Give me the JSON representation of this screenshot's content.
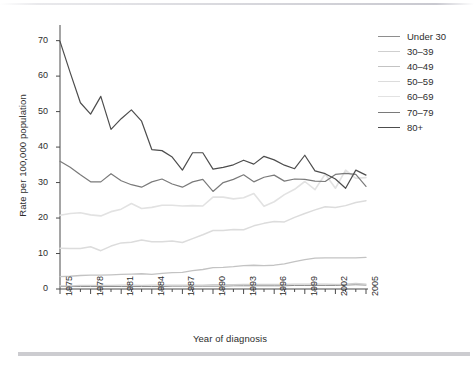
{
  "figure": {
    "background": "#ffffff",
    "rule_color": "#c3c3c8"
  },
  "chart_data": {
    "type": "line",
    "title": "",
    "xlabel": "Year of diagnosis",
    "ylabel": "Rate per 100,000 population",
    "xlim": [
      1975,
      2005
    ],
    "ylim": [
      0,
      73
    ],
    "grid": false,
    "legend_position": "top-right",
    "ytick_labels": [
      "0",
      "10",
      "20",
      "30",
      "40",
      "50",
      "60",
      "70"
    ],
    "ytick_values": [
      0,
      10,
      20,
      30,
      40,
      50,
      60,
      70
    ],
    "xtick_labels": [
      "1975",
      "1978",
      "1981",
      "1984",
      "1987",
      "1990",
      "1993",
      "1996",
      "1999",
      "2002",
      "2005"
    ],
    "xtick_values": [
      1975,
      1978,
      1981,
      1984,
      1987,
      1990,
      1993,
      1996,
      1999,
      2002,
      2005
    ],
    "x": [
      1975,
      1976,
      1977,
      1978,
      1979,
      1980,
      1981,
      1982,
      1983,
      1984,
      1985,
      1986,
      1987,
      1988,
      1989,
      1990,
      1991,
      1992,
      1993,
      1994,
      1995,
      1996,
      1997,
      1998,
      1999,
      2000,
      2001,
      2002,
      2003,
      2004,
      2005
    ],
    "series": [
      {
        "name": "Under 30",
        "color": "#8e8e8e",
        "width": 1.0,
        "values": [
          0.7,
          0.7,
          0.7,
          0.7,
          0.7,
          0.7,
          0.7,
          0.7,
          0.7,
          0.7,
          0.7,
          0.8,
          0.8,
          0.8,
          0.8,
          0.8,
          0.8,
          0.9,
          0.9,
          0.9,
          0.9,
          0.9,
          0.9,
          1.0,
          1.0,
          1.0,
          1.0,
          1.0,
          1.1,
          1.2,
          1.1
        ]
      },
      {
        "name": "30–39",
        "color": "#cfcfcf",
        "width": 1.3,
        "values": [
          0.9,
          0.9,
          1.0,
          1.0,
          1.0,
          1.0,
          1.1,
          1.1,
          1.0,
          1.1,
          1.1,
          1.1,
          1.1,
          1.1,
          1.1,
          1.2,
          1.2,
          1.2,
          1.3,
          1.3,
          1.3,
          1.3,
          1.3,
          1.4,
          1.4,
          1.4,
          1.4,
          1.3,
          1.4,
          1.6,
          1.4
        ]
      },
      {
        "name": "40–49",
        "color": "#c3c3c3",
        "width": 1.3,
        "values": [
          3.5,
          3.6,
          3.8,
          3.9,
          3.9,
          4.0,
          4.1,
          4.2,
          4.3,
          4.1,
          4.4,
          4.6,
          4.7,
          5.2,
          5.5,
          6.0,
          6.1,
          6.3,
          6.6,
          6.7,
          6.6,
          6.7,
          7.1,
          7.7,
          8.3,
          8.7,
          8.8,
          8.8,
          8.8,
          8.8,
          8.9
        ]
      },
      {
        "name": "50–59",
        "color": "#dcdcdc",
        "width": 1.5,
        "values": [
          11.5,
          11.4,
          11.4,
          11.9,
          10.8,
          12.1,
          13.0,
          13.2,
          13.8,
          13.3,
          13.3,
          13.5,
          13.1,
          14.2,
          15.3,
          16.5,
          16.5,
          16.8,
          16.7,
          17.8,
          18.5,
          19.0,
          18.9,
          20.2,
          21.3,
          22.3,
          23.2,
          23.0,
          23.5,
          24.4,
          24.9
        ]
      },
      {
        "name": "60–69",
        "color": "#e2e2e2",
        "width": 1.6,
        "values": [
          20.8,
          21.3,
          21.5,
          20.9,
          20.6,
          21.8,
          22.5,
          24.1,
          22.7,
          23.0,
          23.6,
          23.6,
          23.4,
          23.5,
          23.4,
          25.9,
          25.9,
          25.4,
          25.7,
          26.9,
          23.3,
          24.6,
          26.6,
          28.1,
          30.3,
          28.0,
          32.4,
          28.4,
          33.5,
          31.2,
          31.4
        ]
      },
      {
        "name": "70–79",
        "color": "#7a7a7a",
        "width": 1.2,
        "values": [
          36.0,
          34.3,
          32.2,
          30.2,
          30.2,
          32.5,
          30.5,
          29.4,
          28.7,
          30.2,
          31.0,
          29.6,
          28.7,
          30.2,
          30.9,
          27.5,
          30.0,
          30.9,
          32.2,
          30.2,
          31.5,
          32.1,
          30.4,
          31.0,
          30.9,
          30.4,
          30.3,
          32.3,
          32.6,
          32.3,
          28.9
        ]
      },
      {
        "name": "80+",
        "color": "#4d4d4d",
        "width": 1.2,
        "values": [
          69.8,
          61.0,
          52.5,
          49.3,
          54.3,
          45.0,
          48.0,
          50.5,
          47.3,
          39.3,
          39.0,
          37.2,
          33.5,
          38.4,
          38.4,
          33.8,
          34.3,
          35.0,
          36.3,
          35.2,
          37.4,
          36.4,
          34.9,
          33.9,
          37.7,
          33.3,
          32.5,
          31.0,
          28.4,
          33.5,
          32.1
        ]
      }
    ]
  },
  "caption_fragment": ""
}
